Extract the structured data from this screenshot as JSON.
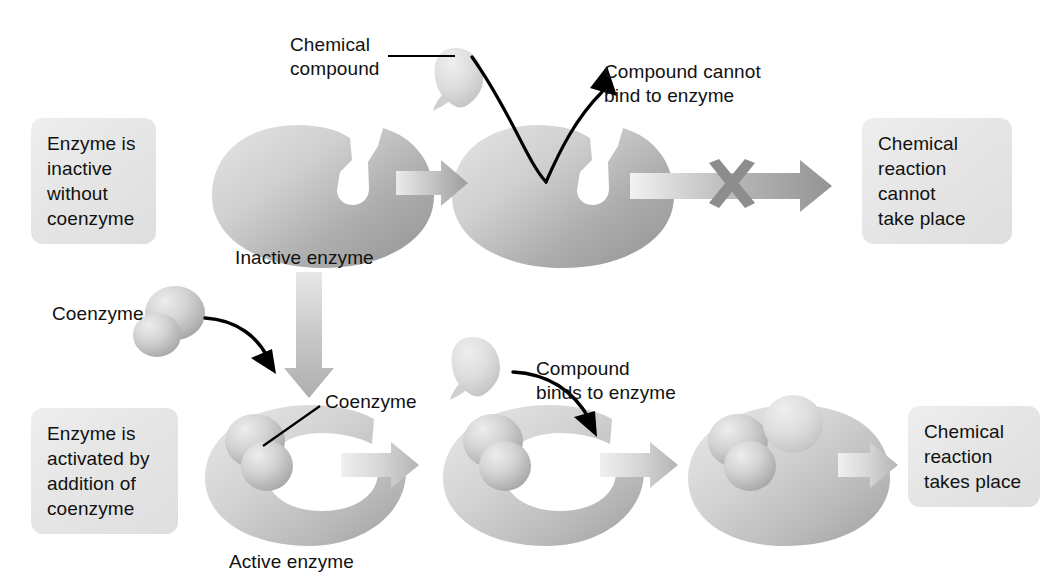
{
  "figure": {
    "background_color": "#ffffff"
  },
  "palette": {
    "enzyme_light": "#d8d8d8",
    "enzyme_mid": "#b9b9b9",
    "enzyme_dark": "#9a9a9a",
    "coenzyme_light": "#dcdcdc",
    "coenzyme_dark": "#a8a8a8",
    "compound_light": "#e2e2e2",
    "compound_dark": "#c2c2c2",
    "arrow_light": "#e3e3e3",
    "arrow_dark": "#a2a2a2",
    "x_mark": "#8d8d8d",
    "box_bg": "#e8e8e8",
    "text": "#111111",
    "black_arrow": "#000000"
  },
  "row_top": {
    "left_box": {
      "lines": [
        "Enzyme is",
        "inactive",
        "without",
        "coenzyme"
      ]
    },
    "compound_label": {
      "lines": [
        "Chemical",
        "compound"
      ]
    },
    "enzyme_caption": "Inactive enzyme",
    "cannot_bind_label": {
      "lines": [
        "Compound cannot",
        "bind to enzyme"
      ]
    },
    "result_box": {
      "lines": [
        "Chemical",
        "reaction",
        "cannot",
        "take place"
      ]
    },
    "blocked": true,
    "block_marker": "x-mark"
  },
  "row_bottom": {
    "left_box": {
      "lines": [
        "Enzyme is",
        "activated by",
        "addition of",
        "coenzyme"
      ]
    },
    "coenzyme_label": "Coenzyme",
    "coenzyme_callout": "Coenzyme",
    "enzyme_caption": "Active enzyme",
    "binds_label": {
      "lines": [
        "Compound",
        "binds to enzyme"
      ]
    },
    "result_box": {
      "lines": [
        "Chemical",
        "reaction",
        "takes place"
      ]
    },
    "blocked": false
  },
  "icons": {
    "enzyme": "crescent-enzyme-shape",
    "coenzyme": "bilobed-coenzyme-shape",
    "compound": "teardrop-compound-shape",
    "process_arrow": "gradient-right-arrow",
    "vertical_arrow": "gradient-down-arrow",
    "pointer_arrow": "curved-black-arrow",
    "block": "gray-x-mark",
    "leader": "leader-line"
  }
}
